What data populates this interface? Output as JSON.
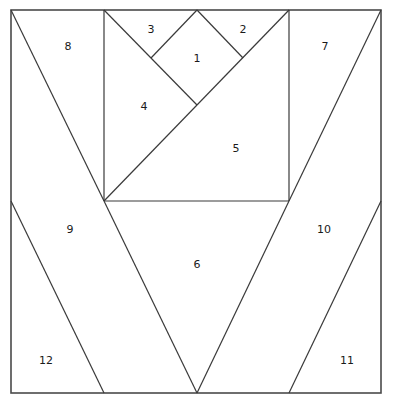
{
  "diagram": {
    "type": "foundation paper piecing pattern",
    "stroke_color": "#3a3a3a",
    "background": "#ffffff",
    "frame": {
      "x1": 11,
      "y1": 10,
      "x2": 381,
      "y2": 393
    },
    "lines": [
      {
        "id": "inner-square-left",
        "x1": 104,
        "y1": 10,
        "x2": 104,
        "y2": 201
      },
      {
        "id": "inner-square-right",
        "x1": 289,
        "y1": 10,
        "x2": 289,
        "y2": 201
      },
      {
        "id": "inner-square-bottom",
        "x1": 104,
        "y1": 201,
        "x2": 289,
        "y2": 201
      },
      {
        "id": "diag-left-to-center",
        "x1": 104,
        "y1": 10,
        "x2": 197,
        "y2": 105
      },
      {
        "id": "diag-main",
        "x1": 104,
        "y1": 201,
        "x2": 289,
        "y2": 10
      },
      {
        "id": "apex-left",
        "x1": 197,
        "y1": 10,
        "x2": 151,
        "y2": 58
      },
      {
        "id": "apex-right",
        "x1": 197,
        "y1": 10,
        "x2": 243,
        "y2": 58
      },
      {
        "id": "outer-left-top",
        "x1": 11,
        "y1": 10,
        "x2": 104,
        "y2": 201
      },
      {
        "id": "outer-right-top",
        "x1": 381,
        "y1": 10,
        "x2": 289,
        "y2": 201
      },
      {
        "id": "v-left",
        "x1": 104,
        "y1": 201,
        "x2": 197,
        "y2": 393
      },
      {
        "id": "v-right",
        "x1": 289,
        "y1": 201,
        "x2": 197,
        "y2": 393
      },
      {
        "id": "outer-left-bottom",
        "x1": 11,
        "y1": 201,
        "x2": 104,
        "y2": 393
      },
      {
        "id": "outer-right-bottom",
        "x1": 381,
        "y1": 201,
        "x2": 289,
        "y2": 393
      }
    ],
    "pieces": [
      {
        "label": "1",
        "x": 197,
        "y": 58
      },
      {
        "label": "2",
        "x": 243,
        "y": 29
      },
      {
        "label": "3",
        "x": 151,
        "y": 29
      },
      {
        "label": "4",
        "x": 144,
        "y": 106
      },
      {
        "label": "5",
        "x": 236,
        "y": 148
      },
      {
        "label": "6",
        "x": 197,
        "y": 264
      },
      {
        "label": "7",
        "x": 325,
        "y": 46
      },
      {
        "label": "8",
        "x": 68,
        "y": 46
      },
      {
        "label": "9",
        "x": 70,
        "y": 229
      },
      {
        "label": "10",
        "x": 324,
        "y": 229
      },
      {
        "label": "11",
        "x": 347,
        "y": 360
      },
      {
        "label": "12",
        "x": 46,
        "y": 360
      }
    ]
  }
}
